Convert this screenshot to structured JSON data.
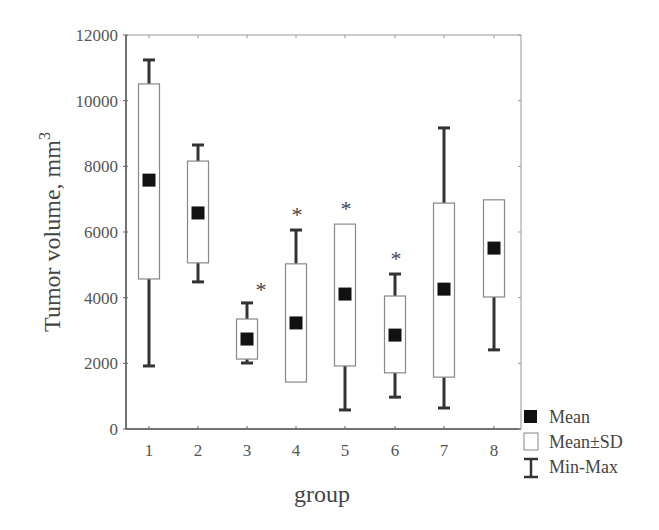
{
  "chart_data": {
    "type": "boxplot",
    "title": "",
    "xlabel": "group",
    "ylabel": "Tumor volume, mm",
    "ylabel_superscript": "3",
    "ylim": [
      0,
      12000
    ],
    "yticks": [
      0,
      2000,
      4000,
      6000,
      8000,
      10000,
      12000
    ],
    "categories": [
      "1",
      "2",
      "3",
      "4",
      "5",
      "6",
      "7",
      "8"
    ],
    "series": [
      {
        "group": "1",
        "mean": 7580,
        "mean_minus_sd": 4570,
        "mean_plus_sd": 10510,
        "min": 1920,
        "max": 11240,
        "significant": false
      },
      {
        "group": "2",
        "mean": 6580,
        "mean_minus_sd": 5060,
        "mean_plus_sd": 8160,
        "min": 4480,
        "max": 8650,
        "significant": false
      },
      {
        "group": "3",
        "mean": 2740,
        "mean_minus_sd": 2130,
        "mean_plus_sd": 3350,
        "min": 2010,
        "max": 3840,
        "significant": true
      },
      {
        "group": "4",
        "mean": 3230,
        "mean_minus_sd": 1430,
        "mean_plus_sd": 5030,
        "min": 1430,
        "max": 6060,
        "significant": true
      },
      {
        "group": "5",
        "mean": 4110,
        "mean_minus_sd": 1920,
        "mean_plus_sd": 6240,
        "min": 580,
        "max": 6240,
        "significant": true
      },
      {
        "group": "6",
        "mean": 2860,
        "mean_minus_sd": 1710,
        "mean_plus_sd": 4050,
        "min": 970,
        "max": 4720,
        "significant": true
      },
      {
        "group": "7",
        "mean": 4260,
        "mean_minus_sd": 1580,
        "mean_plus_sd": 6880,
        "min": 640,
        "max": 9170,
        "significant": false
      },
      {
        "group": "8",
        "mean": 5510,
        "mean_minus_sd": 4020,
        "mean_plus_sd": 6980,
        "min": 2410,
        "max": 6980,
        "significant": false
      }
    ],
    "significance_marker": "*",
    "legend": {
      "position": "bottom-right outside",
      "items": [
        {
          "symbol": "filled-square",
          "label": "Mean"
        },
        {
          "symbol": "open-box",
          "label": "Mean±SD"
        },
        {
          "symbol": "whisker",
          "label": "Min-Max"
        }
      ]
    },
    "grid": false,
    "colors": {
      "mean": "#111111",
      "box_stroke": "#777777",
      "whisker": "#333333",
      "axis": "#444444"
    }
  }
}
